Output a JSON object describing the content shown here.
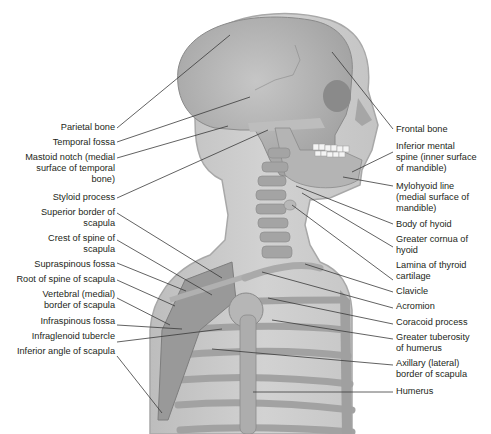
{
  "diagram": {
    "colors": {
      "body_silhouette": "#c9c9c9",
      "bone": "#b0b0b0",
      "bone_dark": "#8e8e8e",
      "leader_line": "#3a3a3a",
      "text": "#231f20",
      "teeth": "#f4f4f4"
    }
  },
  "labels_left": [
    {
      "id": "parietal-bone",
      "lines": [
        "Parietal bone"
      ]
    },
    {
      "id": "temporal-fossa",
      "lines": [
        "Temporal fossa"
      ]
    },
    {
      "id": "mastoid-notch",
      "lines": [
        "Mastoid notch (medial",
        "surface of temporal",
        "bone)"
      ]
    },
    {
      "id": "styloid-process",
      "lines": [
        "Styloid process"
      ]
    },
    {
      "id": "superior-border-of-scapula",
      "lines": [
        "Superior border of",
        "scapula"
      ]
    },
    {
      "id": "crest-of-spine-of-scapula",
      "lines": [
        "Crest of spine of",
        "scapula"
      ]
    },
    {
      "id": "supraspinous-fossa",
      "lines": [
        "Supraspinous fossa"
      ]
    },
    {
      "id": "root-of-spine-of-scapula",
      "lines": [
        "Root of spine of scapula"
      ]
    },
    {
      "id": "vertebral-border-of-scapula",
      "lines": [
        "Vertebral (medial)",
        "border of scapula"
      ]
    },
    {
      "id": "infraspinous-fossa",
      "lines": [
        "Infraspinous fossa"
      ]
    },
    {
      "id": "infraglenoid-tubercle",
      "lines": [
        "Infraglenoid tubercle"
      ]
    },
    {
      "id": "inferior-angle-of-scapula",
      "lines": [
        "Inferior angle of scapula"
      ]
    }
  ],
  "labels_right": [
    {
      "id": "frontal-bone",
      "lines": [
        "Frontal bone"
      ]
    },
    {
      "id": "inferior-mental-spine",
      "lines": [
        "Inferior mental",
        "spine (inner surface",
        "of mandible)"
      ]
    },
    {
      "id": "mylohyoid-line",
      "lines": [
        "Mylohyoid line",
        "(medial surface of",
        "mandible)"
      ]
    },
    {
      "id": "body-of-hyoid",
      "lines": [
        "Body of hyoid"
      ]
    },
    {
      "id": "greater-cornua-of-hyoid",
      "lines": [
        "Greater cornua of",
        "hyoid"
      ]
    },
    {
      "id": "lamina-of-thyroid-cartilage",
      "lines": [
        "Lamina of thyroid",
        "cartilage"
      ]
    },
    {
      "id": "clavicle",
      "lines": [
        "Clavicle"
      ]
    },
    {
      "id": "acromion",
      "lines": [
        "Acromion"
      ]
    },
    {
      "id": "coracoid-process",
      "lines": [
        "Coracoid process"
      ]
    },
    {
      "id": "greater-tuberosity-of-humerus",
      "lines": [
        "Greater tuberosity",
        "of humerus"
      ]
    },
    {
      "id": "axillary-border-of-scapula",
      "lines": [
        "Axillary (lateral)",
        "border of scapula"
      ]
    },
    {
      "id": "humerus",
      "lines": [
        "Humerus"
      ]
    }
  ]
}
